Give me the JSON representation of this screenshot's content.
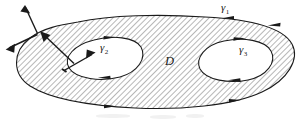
{
  "figure": {
    "kind": "math-diagram",
    "width": 307,
    "height": 123,
    "background_color": "#ffffff",
    "ink_color": "#1a1a1a",
    "hatch_color": "#555555",
    "hatch_angle_degrees": 45,
    "hatch_spacing_px": 4
  },
  "labels": {
    "outer_curve": {
      "symbol": "γ",
      "subscript": "1"
    },
    "left_hole_curve": {
      "symbol": "γ",
      "subscript": "2"
    },
    "right_hole_curve": {
      "symbol": "γ",
      "subscript": "3"
    },
    "region": {
      "symbol": "D"
    }
  },
  "orientation": {
    "outer_curve": "counterclockwise",
    "left_hole_curve": "clockwise",
    "right_hole_curve": "clockwise"
  },
  "vectors": {
    "outer_normal_upper": "outward normal on outer boundary, pointing up-right",
    "outer_normal_lower": "outward normal on outer boundary, pointing down-left",
    "outer_inward_arrow": "arrow pointing up-left toward the outer boundary",
    "hole_normal": "normal on left hole boundary, pointing up-right into the hole"
  }
}
